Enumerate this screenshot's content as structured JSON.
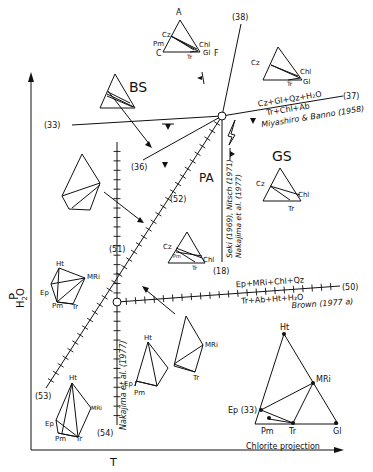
{
  "axes": {
    "y_label_main": "P",
    "y_label_sub": "H",
    "y_label_sub2": "2",
    "y_label_sub3": "O",
    "x_label": "T"
  },
  "fields": {
    "bs": "BS",
    "gs": "GS",
    "pa": "PA"
  },
  "reactions": {
    "r38": "(38)",
    "r37": "(37)",
    "r33": "(33)",
    "r36": "(36)",
    "r52": "(52)",
    "r51": "(51)",
    "r18": "(18)",
    "r50": "(50)",
    "r53": "(53)",
    "r54": "(54)",
    "r37_top": "Cz+Gl+Qz+H₂O",
    "r37_bottom": "Tr+Chl+Ab",
    "r37_ref": "Miyashiro & Banno (1958)",
    "r50_top": "Ep+MRi+Chl+Qz",
    "r50_bottom": "Tr+Ab+Ht+H₂O",
    "r50_ref": "Brown (1977 a)",
    "r18_ref1": "Seki (1969), Nitsch (1971)",
    "r18_ref2": "Nakajima et al. (1977)",
    "r54_ref": "Nakajima et al. (1977)"
  },
  "triangles": {
    "top": {
      "a": "A",
      "cz": "Cz",
      "pm": "Pm",
      "c": "C",
      "chl": "Chl",
      "gl": "Gl",
      "tr": "Tr",
      "f": "F"
    },
    "right_upper": {
      "cz": "Cz",
      "chl": "Chl",
      "tr": "Tr",
      "gl": "Gl"
    },
    "gs": {
      "cz": "Cz",
      "chl": "Chl",
      "tr": "Tr"
    },
    "pa": {
      "cz": "Cz",
      "pm": "Pm",
      "chl": "Chl",
      "tr": "Tr"
    },
    "left_mid": {
      "ht": "Ht",
      "mri": "MRi",
      "ep": "Ep",
      "pm": "Pm",
      "tr": "Tr"
    },
    "center_low": {
      "ht": "Ht",
      "ep": "Ep",
      "pm": "Pm"
    },
    "right_low": {
      "mri": "MRi",
      "tr": "Tr"
    },
    "left_low": {
      "ht": "Ht",
      "mri": "MRi",
      "ep": "Ep",
      "pm": "Pm",
      "tr": "Tr"
    }
  },
  "chlorite_projection": {
    "title": "Chlorite projection",
    "ht": "Ht",
    "mri": "MRi",
    "ep": "Ep (33)",
    "pm": "Pm",
    "tr": "Tr",
    "gl": "Gl"
  }
}
